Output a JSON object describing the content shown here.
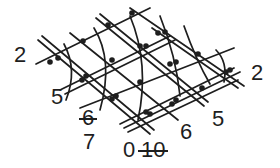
{
  "diagram": {
    "type": "isometric lattice with curved arcs and node dots",
    "line_color": "#1e1e1e",
    "background": "#ffffff",
    "labels": [
      {
        "id": "left-2",
        "text": "2",
        "x": 14,
        "y": 44,
        "strikethrough": false
      },
      {
        "id": "right-2",
        "text": "2",
        "x": 251,
        "y": 62,
        "strikethrough": false
      },
      {
        "id": "left-5",
        "text": "5",
        "x": 51,
        "y": 86,
        "strikethrough": false
      },
      {
        "id": "right-5",
        "text": "5",
        "x": 212,
        "y": 108,
        "strikethrough": false
      },
      {
        "id": "left-6",
        "text": "6",
        "x": 82,
        "y": 107,
        "strikethrough": true
      },
      {
        "id": "right-6",
        "text": "6",
        "x": 180,
        "y": 121,
        "strikethrough": false
      },
      {
        "id": "bottom-7",
        "text": "7",
        "x": 83,
        "y": 131,
        "strikethrough": false
      },
      {
        "id": "bottom-0",
        "text": "0",
        "x": 123,
        "y": 139,
        "strikethrough": false
      },
      {
        "id": "bottom-10",
        "text": "10",
        "x": 141,
        "y": 139,
        "strikethrough": true
      }
    ]
  }
}
